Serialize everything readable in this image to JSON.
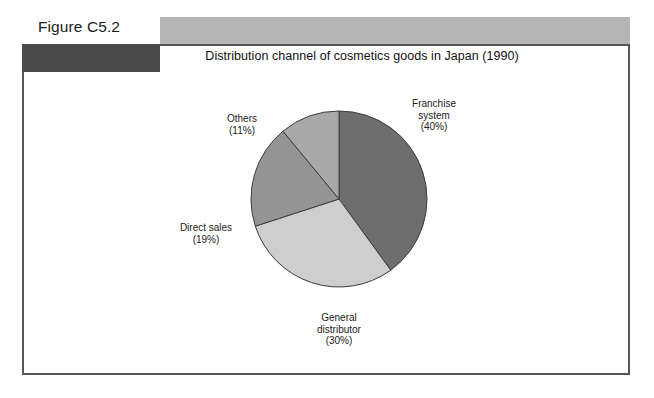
{
  "figure": {
    "label": "Figure C5.2"
  },
  "chart_data": {
    "type": "pie",
    "title": "Distribution channel of cosmetics goods in Japan (1990)",
    "unit": "%",
    "start_angle_deg": 0,
    "direction": "clockwise",
    "legend": "none",
    "labels_position": "outside",
    "categories": [
      "Franchise system",
      "General distributor",
      "Direct sales",
      "Others"
    ],
    "values": [
      40,
      30,
      19,
      11
    ],
    "slices": [
      {
        "name": "Franchise system",
        "value": 40,
        "label_line1": "Franchise",
        "label_line2": "system",
        "label_pct": "(40%)",
        "color": "#6e6e6e"
      },
      {
        "name": "General distributor",
        "value": 30,
        "label_line1": "General",
        "label_line2": "distributor",
        "label_pct": "(30%)",
        "color": "#cecece"
      },
      {
        "name": "Direct sales",
        "value": 19,
        "label_line1": "Direct sales",
        "label_line2": "",
        "label_pct": "(19%)",
        "color": "#949494"
      },
      {
        "name": "Others",
        "value": 11,
        "label_line1": "Others",
        "label_line2": "",
        "label_pct": "(11%)",
        "color": "#a9a9a9"
      }
    ]
  },
  "colors": {
    "top_bar": "#b4b4b4",
    "dark_bar": "#4a4a4a",
    "frame_border": "#55565a",
    "slice_outline": "#3c3c3c",
    "page_background": "#ffffff",
    "text": "#1a1a1a"
  }
}
